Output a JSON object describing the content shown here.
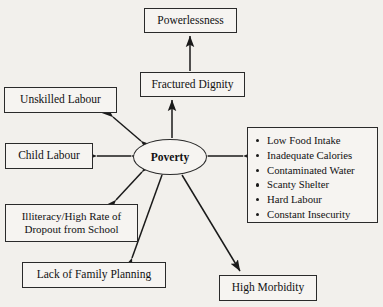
{
  "diagram": {
    "center": {
      "label": "Poverty"
    },
    "nodes": {
      "powerlessness": {
        "label": "Powerlessness"
      },
      "fractured_dignity": {
        "label": "Fractured Dignity"
      },
      "unskilled_labour": {
        "label": "Unskilled Labour"
      },
      "child_labour": {
        "label": "Child Labour"
      },
      "illiteracy": {
        "line1": "Illiteracy/High Rate of",
        "line2": "Dropout from School"
      },
      "family_planning": {
        "label": "Lack of Family Planning"
      },
      "high_morbidity": {
        "label": "High Morbidity"
      },
      "consequences": {
        "items": [
          "Low Food Intake",
          "Inadequate Calories",
          "Contaminated Water",
          "Scanty Shelter",
          "Hard Labour",
          "Constant Insecurity"
        ]
      }
    },
    "connections": [
      {
        "from": "fractured_dignity",
        "to": "powerlessness",
        "style": "single-arrow-up"
      },
      {
        "from": "poverty",
        "to": "fractured_dignity",
        "style": "single-arrow-up"
      },
      {
        "from": "poverty",
        "to": "unskilled_labour",
        "style": "double-arrow"
      },
      {
        "from": "poverty",
        "to": "child_labour",
        "style": "double-arrow"
      },
      {
        "from": "poverty",
        "to": "illiteracy",
        "style": "double-arrow"
      },
      {
        "from": "poverty",
        "to": "consequences",
        "style": "double-arrow"
      },
      {
        "from": "poverty",
        "to": "family_planning",
        "style": "double-arrow"
      },
      {
        "from": "poverty",
        "to": "high_morbidity",
        "style": "single-arrow"
      }
    ],
    "colors": {
      "line": "#1a1a1a",
      "box_border": "#2a2a2a",
      "background": "#f2f0ec",
      "text": "#111111"
    }
  }
}
